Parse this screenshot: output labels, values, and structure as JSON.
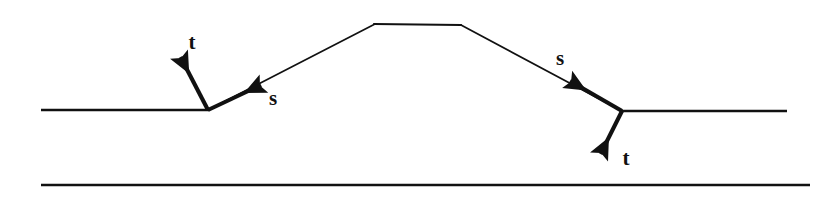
{
  "figure": {
    "background_color": "#ffffff",
    "stroke_color": "#111111",
    "width": 821,
    "height": 199
  },
  "labels": {
    "left_normal": "t",
    "left_tangent": "s",
    "right_tangent": "s",
    "right_normal": "t"
  },
  "geometry": {
    "upper_surface": {
      "left_segment": {
        "x1": 41,
        "y1": 110,
        "x2": 208,
        "y2": 110
      },
      "left_slope": {
        "x1": 208,
        "y1": 110,
        "x2": 375,
        "y2": 24
      },
      "plateau": {
        "x1": 375,
        "y1": 24,
        "x2": 461,
        "y2": 25
      },
      "right_slope": {
        "x1": 461,
        "y1": 25,
        "x2": 622,
        "y2": 111
      },
      "right_segment": {
        "x1": 622,
        "y1": 111,
        "x2": 787,
        "y2": 111
      }
    },
    "lower_surface": {
      "x1": 41,
      "y1": 185,
      "x2": 810,
      "y2": 185
    },
    "vectors": [
      {
        "name": "left-normal",
        "label": "t",
        "x1": 208,
        "y1": 110,
        "x2": 178,
        "y2": 52
      },
      {
        "name": "left-tangent",
        "label": "s",
        "x1": 208,
        "y1": 110,
        "x2": 266,
        "y2": 82
      },
      {
        "name": "right-tangent",
        "label": "s",
        "x1": 622,
        "y1": 111,
        "x2": 565,
        "y2": 78
      },
      {
        "name": "right-normal",
        "label": "t",
        "x1": 622,
        "y1": 111,
        "x2": 598,
        "y2": 160
      }
    ],
    "label_positions": {
      "left_normal": {
        "x": 192,
        "y": 49
      },
      "left_tangent": {
        "x": 271,
        "y": 105
      },
      "right_tangent": {
        "x": 557,
        "y": 65
      },
      "right_normal": {
        "x": 624,
        "y": 164
      }
    }
  }
}
